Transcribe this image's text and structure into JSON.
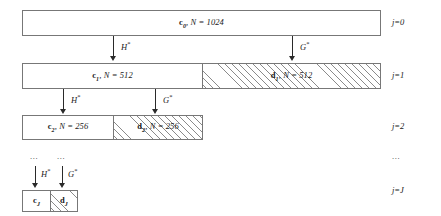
{
  "diagram": {
    "levels": [
      {
        "id": "level-0",
        "j_label": "j=0",
        "boxes": [
          {
            "kind": "approximation",
            "symbol": "c",
            "subscript": "0",
            "n_text": ", N = 1024",
            "label": "c0, N = 1024",
            "hatched": false
          }
        ]
      },
      {
        "id": "level-1",
        "j_label": "j=1",
        "boxes": [
          {
            "kind": "approximation",
            "symbol": "c",
            "subscript": "1",
            "n_text": ", N = 512",
            "label": "c1, N = 512",
            "hatched": false
          },
          {
            "kind": "detail",
            "symbol": "d",
            "subscript": "1",
            "n_text": ", N = 512",
            "label": "d1, N = 512",
            "hatched": true
          }
        ]
      },
      {
        "id": "level-2",
        "j_label": "j=2",
        "boxes": [
          {
            "kind": "approximation",
            "symbol": "c",
            "subscript": "2",
            "n_text": ", N = 256",
            "label": "c2, N = 256",
            "hatched": false
          },
          {
            "kind": "detail",
            "symbol": "d",
            "subscript": "2",
            "n_text": ", N = 256",
            "label": "d2, N = 256",
            "hatched": true
          }
        ]
      },
      {
        "id": "level-J",
        "j_label": "j=J",
        "boxes": [
          {
            "kind": "approximation",
            "symbol": "c",
            "subscript": "J",
            "n_text": "",
            "label": "cJ",
            "hatched": false
          },
          {
            "kind": "detail",
            "symbol": "d",
            "subscript": "J",
            "n_text": "",
            "label": "dJ",
            "hatched": true
          }
        ]
      }
    ],
    "operators": {
      "lowpass": "H",
      "lowpass_sup": "*",
      "highpass": "G",
      "highpass_sup": "*"
    },
    "ellipses": {
      "left": "...",
      "middle": "...",
      "right": "..."
    }
  }
}
